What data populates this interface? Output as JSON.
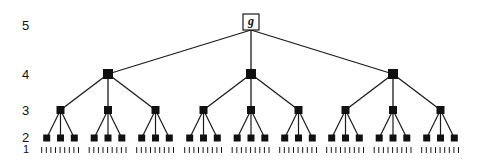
{
  "diagram": {
    "type": "tree",
    "branching_factor": 3,
    "root": {
      "label": "g",
      "level": 5
    },
    "level_labels": [
      {
        "text": "5",
        "y": 19
      },
      {
        "text": "4",
        "y": 68
      },
      {
        "text": "3",
        "y": 104
      },
      {
        "text": "2",
        "y": 131
      },
      {
        "text": "1",
        "y": 144
      }
    ],
    "leaf_marks_per_node": 3,
    "colors": {
      "line": "#1a1a1a",
      "node": "#111111",
      "root_fill": "#ffffff",
      "background": "#ffffff"
    }
  }
}
